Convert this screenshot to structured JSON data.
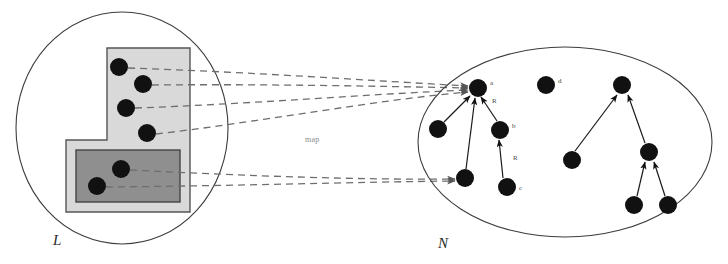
{
  "figure": {
    "title_label_left": "L",
    "title_label_right": "N",
    "map_label": "map",
    "background_color": "#ffffff",
    "ink_color": "#111111",
    "dashed_color": "#6e6e6e",
    "outline_color": "#3d3d3d"
  },
  "left_set": {
    "name": "L",
    "label": "L",
    "boundary": {
      "shape": "circle",
      "cx": 122,
      "cy": 128,
      "rx": 106,
      "ry": 116
    },
    "outer_region": {
      "name": "l-shaped-region",
      "fill": "#d9d9d9",
      "stroke": "#555555",
      "points": "107,48 190,48 190,212 66,212 66,140 107,140"
    },
    "inner_region": {
      "name": "inner-rectangle-region",
      "fill": "#8f8f8f",
      "stroke": "#444444",
      "x": 76,
      "y": 150,
      "width": 104,
      "height": 52
    },
    "points": [
      {
        "id": "p1",
        "cx": 119,
        "cy": 67,
        "r": 9
      },
      {
        "id": "p2",
        "cx": 143,
        "cy": 84,
        "r": 9
      },
      {
        "id": "p3",
        "cx": 126,
        "cy": 108,
        "r": 9
      },
      {
        "id": "p4",
        "cx": 147,
        "cy": 133,
        "r": 9
      },
      {
        "id": "p5",
        "cx": 121,
        "cy": 169,
        "r": 9
      },
      {
        "id": "p6",
        "cx": 97,
        "cy": 186,
        "r": 9
      }
    ]
  },
  "map_arrows": [
    {
      "id": "m1",
      "from": "p1",
      "to": "node-a",
      "path": "M 128,68 C 250,72 360,80 470,86"
    },
    {
      "id": "m2",
      "from": "p2",
      "to": "node-a",
      "path": "M 152,85 C 260,84 370,86 470,88"
    },
    {
      "id": "m3",
      "from": "p3",
      "to": "node-a",
      "path": "M 135,108 C 250,104 370,94 470,90"
    },
    {
      "id": "m4",
      "from": "p4",
      "to": "node-a",
      "path": "M 156,134 C 260,122 375,100 470,92"
    },
    {
      "id": "m5",
      "from": "p5",
      "to": "node-e",
      "path": "M 130,170 C 250,176 360,180 462,180"
    },
    {
      "id": "m6",
      "from": "p6",
      "to": "node-e",
      "path": "M 106,187 C 230,186 355,182 462,181"
    }
  ],
  "right_set": {
    "name": "N",
    "label": "N",
    "boundary": {
      "shape": "ellipse",
      "cx": 565,
      "cy": 142,
      "rx": 147,
      "ry": 95
    },
    "nodes": [
      {
        "id": "node-a",
        "label": "a",
        "cx": 478,
        "cy": 88,
        "r": 9
      },
      {
        "id": "node-f",
        "label": "",
        "cx": 438,
        "cy": 129,
        "r": 9
      },
      {
        "id": "node-b",
        "label": "b",
        "cx": 500,
        "cy": 130,
        "r": 9
      },
      {
        "id": "node-e",
        "label": "",
        "cx": 465,
        "cy": 178,
        "r": 9
      },
      {
        "id": "node-c",
        "label": "c",
        "cx": 507,
        "cy": 187,
        "r": 9
      },
      {
        "id": "node-d",
        "label": "d",
        "cx": 546,
        "cy": 85,
        "r": 9
      },
      {
        "id": "node-g",
        "label": "",
        "cx": 622,
        "cy": 85,
        "r": 9
      },
      {
        "id": "node-h",
        "label": "",
        "cx": 572,
        "cy": 160,
        "r": 9
      },
      {
        "id": "node-i",
        "label": "",
        "cx": 649,
        "cy": 152,
        "r": 9
      },
      {
        "id": "node-j",
        "label": "",
        "cx": 634,
        "cy": 205,
        "r": 9
      },
      {
        "id": "node-k",
        "label": "",
        "cx": 668,
        "cy": 205,
        "r": 9
      }
    ],
    "edges": [
      {
        "id": "e1",
        "from": "node-f",
        "to": "node-a",
        "label": ""
      },
      {
        "id": "e2",
        "from": "node-b",
        "to": "node-a",
        "label": "R"
      },
      {
        "id": "e3",
        "from": "node-e",
        "to": "node-a",
        "label": ""
      },
      {
        "id": "e4",
        "from": "node-c",
        "to": "node-b",
        "label": "R"
      },
      {
        "id": "e5",
        "from": "node-h",
        "to": "node-g",
        "label": ""
      },
      {
        "id": "e6",
        "from": "node-i",
        "to": "node-g",
        "label": ""
      },
      {
        "id": "e7",
        "from": "node-j",
        "to": "node-i",
        "label": ""
      },
      {
        "id": "e8",
        "from": "node-k",
        "to": "node-i",
        "label": ""
      }
    ],
    "edge_labels": [
      {
        "id": "label-R1",
        "text": "R",
        "x": 492,
        "y": 101
      },
      {
        "id": "label-R2",
        "text": "R",
        "x": 513,
        "y": 158
      }
    ]
  }
}
